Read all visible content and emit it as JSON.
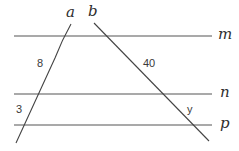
{
  "diagram": {
    "colors": {
      "line": "#4a4a4a",
      "text": "#333333",
      "background": "#ffffff"
    },
    "parallel_lines": [
      {
        "name": "m",
        "y": 36
      },
      {
        "name": "n",
        "y": 94
      },
      {
        "name": "p",
        "y": 125
      }
    ],
    "transversals": [
      {
        "name": "a"
      },
      {
        "name": "b"
      }
    ],
    "labels": {
      "line_m": "m",
      "line_n": "n",
      "line_p": "p",
      "line_a": "a",
      "line_b": "b",
      "segment_a_mn": "8",
      "segment_b_mn": "40",
      "segment_a_np": "3",
      "segment_b_np": "y"
    }
  }
}
